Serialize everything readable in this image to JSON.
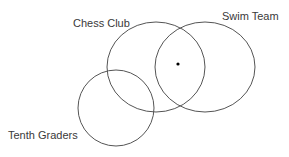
{
  "diagram": {
    "type": "venn",
    "sets": [
      {
        "id": "chess",
        "label": "Chess Club",
        "shape": {
          "cx": 156,
          "cy": 67,
          "rx": 49,
          "ry": 45
        },
        "label_pos": {
          "x": 73,
          "y": 27
        }
      },
      {
        "id": "swim",
        "label": "Swim Team",
        "shape": {
          "cx": 205,
          "cy": 67,
          "rx": 50,
          "ry": 45
        },
        "label_pos": {
          "x": 222,
          "y": 20
        }
      },
      {
        "id": "tenth",
        "label": "Tenth Graders",
        "shape": {
          "cx": 116,
          "cy": 108,
          "rx": 38,
          "ry": 38
        },
        "label_pos": {
          "x": 8,
          "y": 139
        }
      }
    ],
    "point": {
      "description": "point in Chess Club and Swim Team, not Tenth Graders",
      "x": 178,
      "y": 64,
      "r": 1.6
    },
    "colors": {
      "stroke": "#555555",
      "text": "#3a3a3a",
      "point": "#000000",
      "background": "#ffffff"
    }
  }
}
